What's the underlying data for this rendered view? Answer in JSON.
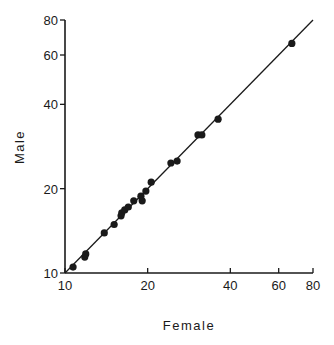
{
  "chart_data": {
    "type": "scatter",
    "title": "",
    "xlabel": "Female",
    "ylabel": "Male",
    "xscale": "log",
    "yscale": "log",
    "xlim": [
      10,
      80
    ],
    "ylim": [
      10,
      80
    ],
    "xticks": [
      10,
      20,
      40,
      60,
      80
    ],
    "yticks": [
      10,
      20,
      40,
      60,
      80
    ],
    "grid": false,
    "legend": null,
    "reference_line": {
      "type": "identity",
      "description": "line of equality y = x",
      "from": [
        10,
        10
      ],
      "to": [
        80,
        80
      ]
    },
    "series": [
      {
        "name": "points",
        "points": [
          {
            "x": 10.7,
            "y": 10.5
          },
          {
            "x": 11.8,
            "y": 11.4
          },
          {
            "x": 11.9,
            "y": 11.7
          },
          {
            "x": 13.9,
            "y": 13.9
          },
          {
            "x": 15.1,
            "y": 14.9
          },
          {
            "x": 16.0,
            "y": 16.0
          },
          {
            "x": 16.1,
            "y": 16.4
          },
          {
            "x": 16.5,
            "y": 16.8
          },
          {
            "x": 17.0,
            "y": 17.2
          },
          {
            "x": 17.8,
            "y": 18.1
          },
          {
            "x": 18.9,
            "y": 18.8
          },
          {
            "x": 19.1,
            "y": 18.1
          },
          {
            "x": 19.7,
            "y": 19.6
          },
          {
            "x": 20.6,
            "y": 21.1
          },
          {
            "x": 24.3,
            "y": 24.7
          },
          {
            "x": 25.6,
            "y": 25.1
          },
          {
            "x": 30.5,
            "y": 31.1
          },
          {
            "x": 31.5,
            "y": 31.1
          },
          {
            "x": 36.1,
            "y": 35.4
          },
          {
            "x": 67.0,
            "y": 66.0
          }
        ]
      }
    ]
  },
  "layout": {
    "plot": {
      "x0": 65,
      "x1": 313,
      "y0": 273,
      "y1": 20
    },
    "marker_radius": 3.6,
    "colors": {
      "ink": "#1a1a1a",
      "background": "#ffffff"
    }
  }
}
